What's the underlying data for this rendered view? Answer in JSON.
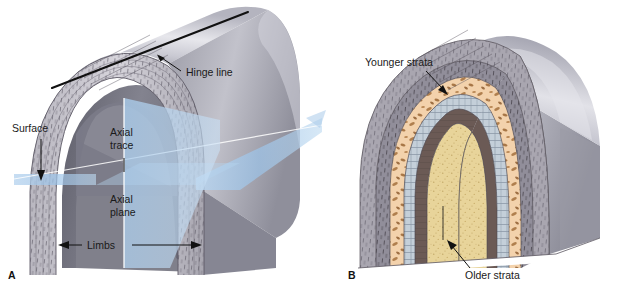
{
  "figure": {
    "type": "geology-diagram",
    "background_color": "#ffffff",
    "width": 620,
    "height": 295
  },
  "panels": [
    {
      "id": "A",
      "label": "A",
      "label_pos": [
        8,
        277
      ],
      "description": "Cutaway block diagram of an anticline showing fold geometry elements",
      "annotations": [
        {
          "name": "hinge-line",
          "text": "Hinge line",
          "text_pos": [
            185,
            76
          ],
          "anchor": "start",
          "leader": [
            [
              180,
              72
            ],
            [
              158,
              57
            ]
          ],
          "arrow": "start"
        },
        {
          "name": "surface",
          "text": "Surface",
          "text_pos": [
            12,
            132
          ],
          "anchor": "start",
          "leader": [
            [
              41,
              140
            ],
            [
              41,
              180
            ]
          ],
          "arrow": "end"
        },
        {
          "name": "axial-trace",
          "text": "Axial trace",
          "text_lines": [
            "Axial",
            "trace"
          ],
          "text_pos": [
            110,
            137
          ],
          "anchor": "start",
          "leader": [
            [
              124,
              160
            ],
            [
              124,
              172
            ]
          ],
          "arrow": "none"
        },
        {
          "name": "axial-plane",
          "text": "Axial plane",
          "text_lines": [
            "Axial",
            "plane"
          ],
          "text_pos": [
            110,
            204
          ],
          "anchor": "start",
          "leader": null,
          "arrow": "none"
        },
        {
          "name": "limbs",
          "text": "Limbs",
          "text_pos": [
            88,
            248
          ],
          "anchor": "start",
          "leader": [
            [
              62,
              245
            ],
            [
              198,
              245
            ]
          ],
          "arrow": "both"
        }
      ]
    },
    {
      "id": "B",
      "label": "B",
      "label_pos": [
        348,
        277
      ],
      "description": "Cutaway block diagram of an anticline showing relative ages of strata",
      "annotations": [
        {
          "name": "younger-strata",
          "text": "Younger strata",
          "text_pos": [
            365,
            66
          ],
          "anchor": "start",
          "leader": [
            [
              425,
              72
            ],
            [
              444,
              92
            ]
          ],
          "arrow": "end"
        },
        {
          "name": "older-strata",
          "text": "Older strata",
          "text_pos": [
            465,
            277
          ],
          "anchor": "start",
          "leader": [
            [
              470,
              268
            ],
            [
              449,
              243
            ]
          ],
          "arrow": "end"
        }
      ]
    }
  ],
  "strata": {
    "note": "Nested fold layers from outermost (youngest) to innermost (oldest)",
    "layers": [
      {
        "name": "outer-gray-shale",
        "color": "#a9a6b0",
        "rock": "shale"
      },
      {
        "name": "gray-banded-unit",
        "color": "#8e8b96",
        "rock": "shale"
      },
      {
        "name": "tan-conglomerate",
        "color": "#f3d2ac",
        "rock": "conglomerate",
        "clast_color": "#b07f4e"
      },
      {
        "name": "blue-gray-limestone",
        "color": "#c4cfd9",
        "rock": "limestone"
      },
      {
        "name": "dark-brown-unit",
        "color": "#6b5a55",
        "rock": "mudstone"
      },
      {
        "name": "yellow-sandstone-core",
        "color": "#e8d49a",
        "rock": "sandstone"
      }
    ]
  },
  "colors": {
    "block_top_light": "#e4e4e8",
    "block_top_dark": "#9d9da8",
    "block_side": "#8b8b96",
    "cut_face": "#7e7e8a",
    "plane_blue": "#9cc3e8",
    "hinge_black": "#111111",
    "label_text": "#1a1a1a"
  }
}
